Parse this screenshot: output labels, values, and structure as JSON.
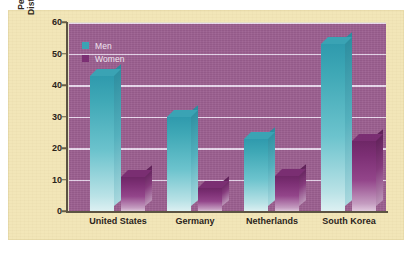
{
  "chart_data": {
    "type": "bar",
    "title": "",
    "subtitle": "",
    "xlabel": "",
    "ylabel_lines": [
      "Percentage Reporting More",
      "Distress over Sexual Infidelity"
    ],
    "ylabel": "Percentage Reporting More Distress over Sexual Infidelity",
    "categories": [
      "United States",
      "Germany",
      "Netherlands",
      "South Korea"
    ],
    "series": [
      {
        "name": "Men",
        "color": "#3aa3b4",
        "values": [
          43,
          30,
          23,
          53
        ]
      },
      {
        "name": "Women",
        "color": "#7c2f74",
        "values": [
          11,
          7.5,
          11.5,
          22.5
        ]
      }
    ],
    "ylim": [
      0,
      60
    ],
    "ytick_values": [
      0,
      10,
      20,
      30,
      40,
      50,
      60
    ],
    "ytick_labels": [
      "0",
      "10",
      "20",
      "30",
      "40",
      "50",
      "60"
    ],
    "grid": true,
    "grid_axis": "y",
    "legend_position": "upper-left-inside",
    "style": {
      "plot_background": "#9c5f90",
      "figure_background": "#f2e6b8",
      "gridline_color": "#ead9ee",
      "axis_color": "#5c5442",
      "text_color": "#2b241b",
      "legend_text_color": "#efe6ef",
      "three_d_bars": true
    }
  },
  "legend": {
    "items": [
      {
        "label": "Men"
      },
      {
        "label": "Women"
      }
    ]
  }
}
